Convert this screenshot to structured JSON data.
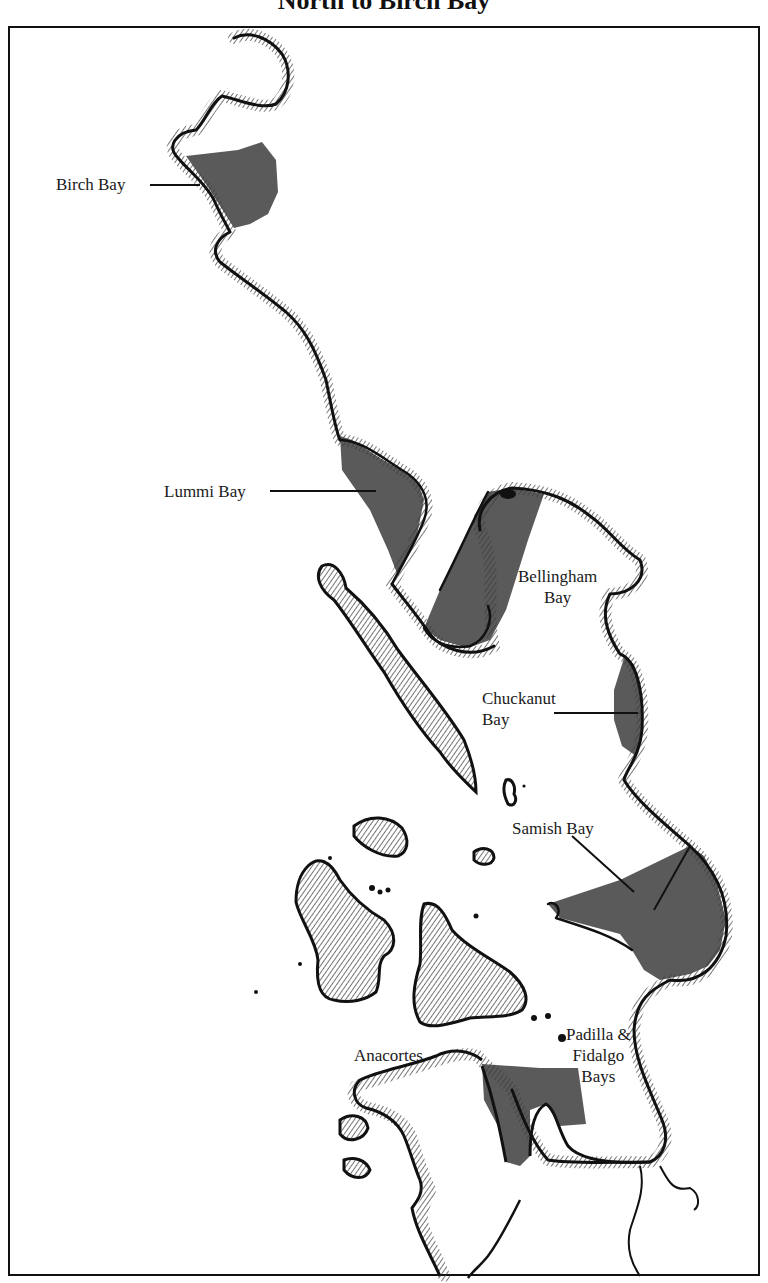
{
  "title": "North to Birch Bay",
  "colors": {
    "bay_fill": "#5a5a5a",
    "coast_line": "#111111",
    "hatching": "#3a3a3a",
    "background": "#ffffff"
  },
  "labels": {
    "birch_bay": "Birch Bay",
    "lummi_bay": "Lummi Bay",
    "bellingham_bay_line1": "Bellingham",
    "bellingham_bay_line2": "Bay",
    "chuckanut_bay_line1": "Chuckanut",
    "chuckanut_bay_line2": "Bay",
    "samish_bay": "Samish Bay",
    "anacortes": "Anacortes",
    "padilla_line1": "Padilla &",
    "padilla_line2": "Fidalgo",
    "padilla_line3": "Bays"
  }
}
